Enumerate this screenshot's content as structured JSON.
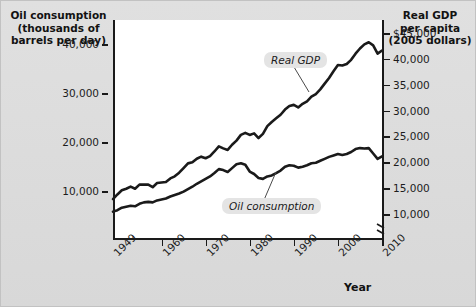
{
  "figure": {
    "left_axis_title": "Oil consumption\n(thousands of\nbarrels per day)",
    "left_axis_title_lines": [
      "Oil consumption",
      "(thousands of",
      "barrels per day)"
    ],
    "right_axis_title_lines": [
      "Real GDP",
      "per capita",
      "(2005 dollars)"
    ],
    "x_axis_title": "Year"
  },
  "chart_data": {
    "type": "line",
    "title": "",
    "subtitle": "",
    "xlabel": "Year",
    "ylabel": "Oil consumption (thousands of barrels per day)",
    "ylabel_right": "Real GDP per capita (2005 dollars)",
    "grid": false,
    "legend": "inline-annotations",
    "xlim": [
      1949,
      2010
    ],
    "xticks": [
      1949,
      1960,
      1970,
      1980,
      1990,
      2000,
      2010
    ],
    "xticklabels": [
      "1949",
      "1960",
      "1970",
      "1980",
      "1990",
      "2000",
      "2010"
    ],
    "ylim_left": [
      0,
      45000
    ],
    "yticks_left": [
      10000,
      20000,
      30000,
      40000
    ],
    "yticklabels_left": [
      "10,000",
      "20,000",
      "30,000",
      "40,000"
    ],
    "ylim_right": [
      5000,
      47500
    ],
    "yticks_right": [
      10000,
      15000,
      20000,
      25000,
      30000,
      35000,
      40000,
      45000
    ],
    "yticklabels_right": [
      "10,000",
      "15,000",
      "20,000",
      "25,000",
      "30,000",
      "35,000",
      "40,000",
      "$45,000"
    ],
    "axis_break_right": true,
    "annotations": [
      {
        "text": "Real GDP",
        "series": "real_gdp"
      },
      {
        "text": "Oil consumption",
        "series": "oil_consumption"
      }
    ],
    "series": [
      {
        "name": "Oil consumption",
        "axis": "left",
        "units": "thousands of barrels per day",
        "x": [
          1949,
          1950,
          1951,
          1952,
          1953,
          1954,
          1955,
          1956,
          1957,
          1958,
          1959,
          1960,
          1961,
          1962,
          1963,
          1964,
          1965,
          1966,
          1967,
          1968,
          1969,
          1970,
          1971,
          1972,
          1973,
          1974,
          1975,
          1976,
          1977,
          1978,
          1979,
          1980,
          1981,
          1982,
          1983,
          1984,
          1985,
          1986,
          1987,
          1988,
          1989,
          1990,
          1991,
          1992,
          1993,
          1994,
          1995,
          1996,
          1997,
          1998,
          1999,
          2000,
          2001,
          2002,
          2003,
          2004,
          2005,
          2006,
          2007,
          2008,
          2009,
          2010
        ],
        "values": [
          5800,
          6100,
          6600,
          6800,
          7000,
          6900,
          7400,
          7700,
          7800,
          7700,
          8100,
          8300,
          8500,
          8900,
          9200,
          9500,
          9900,
          10400,
          10900,
          11500,
          12000,
          12500,
          13000,
          13700,
          14500,
          14300,
          13900,
          14700,
          15500,
          15700,
          15400,
          14000,
          13500,
          12700,
          12500,
          13000,
          13200,
          13700,
          14200,
          15000,
          15300,
          15200,
          14800,
          15000,
          15300,
          15700,
          15800,
          16200,
          16600,
          17000,
          17300,
          17600,
          17400,
          17600,
          18000,
          18600,
          18800,
          18700,
          18800,
          17700,
          16600,
          17100
        ]
      },
      {
        "name": "Real GDP per capita",
        "axis": "right",
        "units": "2005 dollars",
        "x": [
          1949,
          1950,
          1951,
          1952,
          1953,
          1954,
          1955,
          1956,
          1957,
          1958,
          1959,
          1960,
          1961,
          1962,
          1963,
          1964,
          1965,
          1966,
          1967,
          1968,
          1969,
          1970,
          1971,
          1972,
          1973,
          1974,
          1975,
          1976,
          1977,
          1978,
          1979,
          1980,
          1981,
          1982,
          1983,
          1984,
          1985,
          1986,
          1987,
          1988,
          1989,
          1990,
          1991,
          1992,
          1993,
          1994,
          1995,
          1996,
          1997,
          1998,
          1999,
          2000,
          2001,
          2002,
          2003,
          2004,
          2005,
          2006,
          2007,
          2008,
          2009,
          2010
        ],
        "values": [
          12900,
          13800,
          14600,
          14900,
          15300,
          14900,
          15700,
          15700,
          15700,
          15200,
          16000,
          16100,
          16200,
          16900,
          17300,
          18000,
          18900,
          19800,
          20000,
          20700,
          21100,
          20800,
          21200,
          22100,
          23100,
          22700,
          22400,
          23400,
          24200,
          25300,
          25700,
          25300,
          25600,
          24700,
          25500,
          27000,
          27800,
          28500,
          29200,
          30200,
          30900,
          31100,
          30600,
          31300,
          31800,
          32700,
          33200,
          34100,
          35200,
          36300,
          37600,
          38800,
          38700,
          39000,
          39800,
          41000,
          42000,
          42800,
          43200,
          42600,
          41000,
          41600
        ]
      }
    ]
  }
}
